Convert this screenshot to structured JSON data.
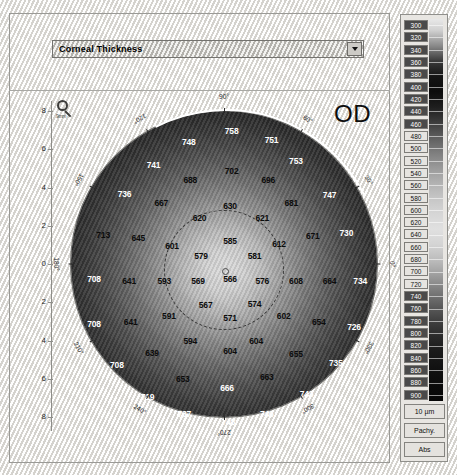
{
  "selector": {
    "value": "Corneal Thickness",
    "arrow_icon": "chevron-down-icon"
  },
  "map": {
    "eye_label": "OD",
    "magnifier_icon": "magnifier-icon",
    "magnifier_caption": "9mm",
    "center_marker": "center-point",
    "axis_x": {
      "left_label": "T",
      "right_label": "N",
      "ticks": [
        "8",
        "6",
        "4",
        "2",
        "0",
        "2",
        "4",
        "6",
        "8"
      ]
    },
    "axis_y": {
      "ticks": [
        "8",
        "6",
        "4",
        "2",
        "0",
        "2",
        "4",
        "6",
        "8"
      ]
    },
    "degrees": [
      "0°",
      "30°",
      "60°",
      "90°",
      "120°",
      "150°",
      "180°",
      "210°",
      "240°",
      "270°",
      "300°",
      "330°"
    ]
  },
  "scale": {
    "unit_button": "10 µm",
    "mode_button": "Pachy.",
    "abs_button": "Abs",
    "labels": [
      "300",
      "320",
      "340",
      "360",
      "380",
      "400",
      "420",
      "440",
      "460",
      "480",
      "500",
      "520",
      "540",
      "560",
      "580",
      "600",
      "620",
      "640",
      "660",
      "680",
      "700",
      "720",
      "740",
      "760",
      "780",
      "800",
      "820",
      "840",
      "860",
      "880",
      "900"
    ]
  },
  "chart_data": {
    "type": "heatmap",
    "title": "Corneal Thickness",
    "subtitle": "OD",
    "unit": "µm",
    "colorbar_range": [
      300,
      900
    ],
    "colorbar_step": 20,
    "xlabel": "T — N (mm)",
    "ylabel": "mm",
    "xlim": [
      -9,
      9
    ],
    "ylim": [
      -9,
      9
    ],
    "grid": false,
    "center_value": 566,
    "min_value": 566,
    "max_value": 758,
    "points": [
      {
        "label": "748",
        "x": 38.5,
        "y": 10.0,
        "tone": "light"
      },
      {
        "label": "758",
        "x": 52.5,
        "y": 6.5,
        "tone": "light"
      },
      {
        "label": "751",
        "x": 65.5,
        "y": 9.5,
        "tone": "light"
      },
      {
        "label": "741",
        "x": 27.0,
        "y": 17.5,
        "tone": "light"
      },
      {
        "label": "753",
        "x": 73.5,
        "y": 16.5,
        "tone": "light"
      },
      {
        "label": "688",
        "x": 39.0,
        "y": 22.5,
        "tone": "dark"
      },
      {
        "label": "702",
        "x": 52.5,
        "y": 19.5,
        "tone": "dark"
      },
      {
        "label": "696",
        "x": 64.5,
        "y": 22.5,
        "tone": "dark"
      },
      {
        "label": "736",
        "x": 17.5,
        "y": 27.0,
        "tone": "light"
      },
      {
        "label": "667",
        "x": 29.5,
        "y": 30.0,
        "tone": "dark"
      },
      {
        "label": "681",
        "x": 72.0,
        "y": 30.0,
        "tone": "dark"
      },
      {
        "label": "747",
        "x": 84.5,
        "y": 27.5,
        "tone": "light"
      },
      {
        "label": "630",
        "x": 52.0,
        "y": 31.0,
        "tone": "dark"
      },
      {
        "label": "620",
        "x": 42.0,
        "y": 35.0,
        "tone": "dark"
      },
      {
        "label": "621",
        "x": 62.5,
        "y": 35.0,
        "tone": "dark"
      },
      {
        "label": "713",
        "x": 10.5,
        "y": 40.5,
        "tone": "dark"
      },
      {
        "label": "645",
        "x": 22.0,
        "y": 41.5,
        "tone": "dark"
      },
      {
        "label": "601",
        "x": 33.0,
        "y": 44.0,
        "tone": "dark"
      },
      {
        "label": "585",
        "x": 52.0,
        "y": 42.5,
        "tone": "dark"
      },
      {
        "label": "612",
        "x": 68.0,
        "y": 43.5,
        "tone": "dark"
      },
      {
        "label": "671",
        "x": 79.0,
        "y": 41.0,
        "tone": "dark"
      },
      {
        "label": "730",
        "x": 90.0,
        "y": 40.0,
        "tone": "light"
      },
      {
        "label": "579",
        "x": 42.5,
        "y": 47.5,
        "tone": "dark"
      },
      {
        "label": "581",
        "x": 60.0,
        "y": 47.5,
        "tone": "dark"
      },
      {
        "label": "708",
        "x": 7.5,
        "y": 55.0,
        "tone": "light"
      },
      {
        "label": "641",
        "x": 19.0,
        "y": 55.5,
        "tone": "dark"
      },
      {
        "label": "593",
        "x": 30.5,
        "y": 55.5,
        "tone": "dark"
      },
      {
        "label": "569",
        "x": 41.5,
        "y": 55.5,
        "tone": "dark"
      },
      {
        "label": "566",
        "x": 52.0,
        "y": 55.0,
        "tone": "dark"
      },
      {
        "label": "576",
        "x": 62.5,
        "y": 55.5,
        "tone": "dark"
      },
      {
        "label": "608",
        "x": 73.5,
        "y": 55.5,
        "tone": "dark"
      },
      {
        "label": "664",
        "x": 84.5,
        "y": 55.5,
        "tone": "dark"
      },
      {
        "label": "734",
        "x": 94.5,
        "y": 55.5,
        "tone": "light"
      },
      {
        "label": "567",
        "x": 44.0,
        "y": 63.5,
        "tone": "dark"
      },
      {
        "label": "574",
        "x": 60.0,
        "y": 63.0,
        "tone": "dark"
      },
      {
        "label": "591",
        "x": 32.0,
        "y": 67.0,
        "tone": "dark"
      },
      {
        "label": "571",
        "x": 52.0,
        "y": 67.5,
        "tone": "dark"
      },
      {
        "label": "602",
        "x": 69.5,
        "y": 67.0,
        "tone": "dark"
      },
      {
        "label": "641",
        "x": 19.5,
        "y": 69.0,
        "tone": "dark"
      },
      {
        "label": "654",
        "x": 81.0,
        "y": 69.0,
        "tone": "dark"
      },
      {
        "label": "708",
        "x": 7.5,
        "y": 69.5,
        "tone": "light"
      },
      {
        "label": "726",
        "x": 92.5,
        "y": 70.5,
        "tone": "light"
      },
      {
        "label": "594",
        "x": 39.0,
        "y": 75.0,
        "tone": "dark"
      },
      {
        "label": "604",
        "x": 60.5,
        "y": 75.0,
        "tone": "dark"
      },
      {
        "label": "604",
        "x": 52.0,
        "y": 78.5,
        "tone": "dark"
      },
      {
        "label": "639",
        "x": 26.5,
        "y": 79.0,
        "tone": "dark"
      },
      {
        "label": "655",
        "x": 73.5,
        "y": 79.5,
        "tone": "dark"
      },
      {
        "label": "708",
        "x": 15.0,
        "y": 83.0,
        "tone": "light"
      },
      {
        "label": "735",
        "x": 86.5,
        "y": 82.5,
        "tone": "light"
      },
      {
        "label": "653",
        "x": 36.5,
        "y": 87.5,
        "tone": "dark"
      },
      {
        "label": "663",
        "x": 64.0,
        "y": 87.0,
        "tone": "dark"
      },
      {
        "label": "666",
        "x": 51.0,
        "y": 90.5,
        "tone": "light"
      },
      {
        "label": "719",
        "x": 25.0,
        "y": 93.5,
        "tone": "light"
      },
      {
        "label": "743",
        "x": 77.0,
        "y": 92.5,
        "tone": "light"
      },
      {
        "label": "737",
        "x": 37.0,
        "y": 99.0,
        "tone": "light"
      },
      {
        "label": "748",
        "x": 51.5,
        "y": 101.5,
        "tone": "light"
      },
      {
        "label": "746",
        "x": 64.0,
        "y": 99.0,
        "tone": "light"
      }
    ]
  }
}
